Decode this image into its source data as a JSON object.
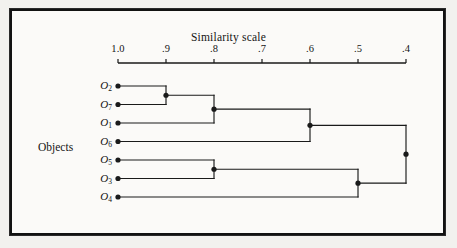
{
  "figure": {
    "background_color": "#fbfaf8",
    "border_color": "#121212",
    "line_color": "#1a1a1a"
  },
  "chart_data": {
    "type": "dendrogram",
    "title": "Similarity scale",
    "xlabel": "Similarity scale",
    "ylabel": "Objects",
    "axis_orientation": "horizontal-top",
    "axis_direction": "decreasing",
    "xlim": [
      1.0,
      0.4
    ],
    "grid": false,
    "legend": null,
    "tick_values": [
      1.0,
      0.9,
      0.8,
      0.7,
      0.6,
      0.5,
      0.4
    ],
    "tick_labels": [
      "1.0",
      ".9",
      ".8",
      ".7",
      ".6",
      ".5",
      ".4"
    ],
    "leaves": [
      "O2",
      "O7",
      "O1",
      "O6",
      "O5",
      "O3",
      "O4"
    ],
    "leaf_labels": [
      "O",
      "O",
      "O",
      "O",
      "O",
      "O",
      "O"
    ],
    "leaf_subscripts": [
      "2",
      "7",
      "1",
      "6",
      "5",
      "3",
      "4"
    ],
    "leaf_similarity": 1.0,
    "merges": [
      {
        "id": "m1",
        "members": [
          "O2",
          "O7"
        ],
        "similarity": 0.9
      },
      {
        "id": "m2",
        "members": [
          "m1",
          "O1"
        ],
        "similarity": 0.8
      },
      {
        "id": "m3",
        "members": [
          "O5",
          "O3"
        ],
        "similarity": 0.8
      },
      {
        "id": "m4",
        "members": [
          "m2",
          "O6"
        ],
        "similarity": 0.6
      },
      {
        "id": "m5",
        "members": [
          "m3",
          "O4"
        ],
        "similarity": 0.5
      },
      {
        "id": "m6",
        "members": [
          "m4",
          "m5"
        ],
        "similarity": 0.4
      }
    ]
  },
  "axis": {
    "title": "Similarity scale",
    "ticks": [
      {
        "label": "1.0",
        "value": 1.0
      },
      {
        "label": ".9",
        "value": 0.9
      },
      {
        "label": ".8",
        "value": 0.8
      },
      {
        "label": ".7",
        "value": 0.7
      },
      {
        "label": ".6",
        "value": 0.6
      },
      {
        "label": ".5",
        "value": 0.5
      },
      {
        "label": ".4",
        "value": 0.4
      }
    ]
  },
  "objects_label": "Objects"
}
